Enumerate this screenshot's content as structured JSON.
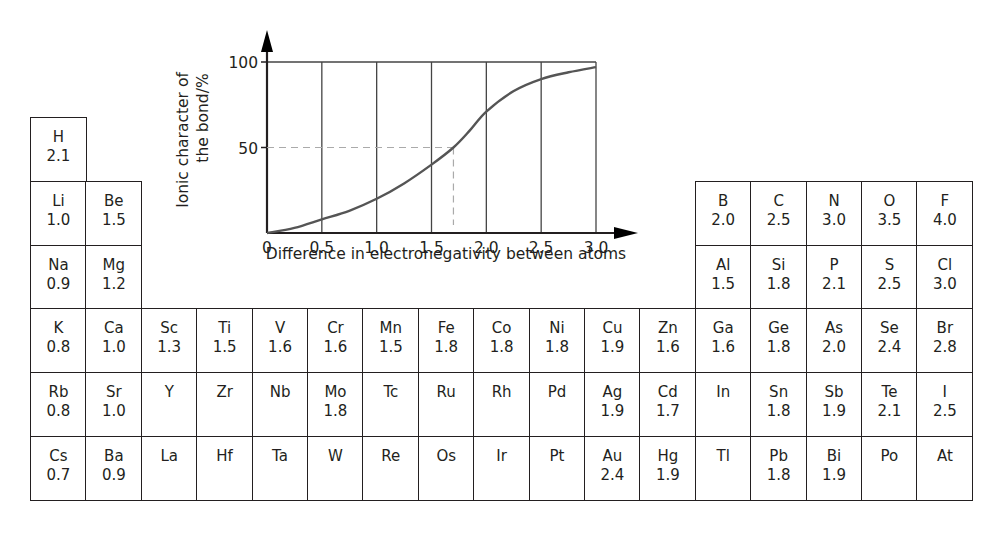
{
  "chart_data": {
    "type": "line",
    "title": "",
    "xlabel": "Difference in electronegativity between atoms",
    "ylabel_lines": [
      "Ionic character of",
      "the bond/%"
    ],
    "xlim": [
      0,
      3.0
    ],
    "ylim": [
      0,
      100
    ],
    "x_ticks": [
      "0",
      "0.5",
      "1.0",
      "1.5",
      "2.0",
      "2.5",
      "3.0"
    ],
    "x_tick_values": [
      0,
      0.5,
      1.0,
      1.5,
      2.0,
      2.5,
      3.0
    ],
    "y_ticks": [
      "50",
      "100"
    ],
    "y_tick_values": [
      50,
      100
    ],
    "grid": "vertical lines at each x tick",
    "series": [
      {
        "name": "Ionic character",
        "x": [
          0,
          0.25,
          0.5,
          0.75,
          1.0,
          1.25,
          1.5,
          1.7,
          1.85,
          2.0,
          2.25,
          2.5,
          2.75,
          3.0
        ],
        "y": [
          0,
          3,
          8,
          13,
          20,
          29,
          40,
          50,
          60,
          71,
          83,
          90,
          94,
          97
        ]
      }
    ],
    "annotations": [
      {
        "type": "dashed-guide",
        "x": 1.7,
        "y": 50,
        "text": ""
      }
    ],
    "colors": {
      "curve": "#555555",
      "axes": "#231f20",
      "grid": "#444444",
      "guide": "#aaaaaa"
    }
  },
  "periodic_table": {
    "caption": "Pauling electronegativity values",
    "rows": [
      [
        {
          "col": 1,
          "sym": "H",
          "en": "2.1"
        }
      ],
      [
        {
          "col": 1,
          "sym": "Li",
          "en": "1.0"
        },
        {
          "col": 2,
          "sym": "Be",
          "en": "1.5"
        },
        {
          "col": 13,
          "sym": "B",
          "en": "2.0"
        },
        {
          "col": 14,
          "sym": "C",
          "en": "2.5"
        },
        {
          "col": 15,
          "sym": "N",
          "en": "3.0"
        },
        {
          "col": 16,
          "sym": "O",
          "en": "3.5"
        },
        {
          "col": 17,
          "sym": "F",
          "en": "4.0"
        }
      ],
      [
        {
          "col": 1,
          "sym": "Na",
          "en": "0.9"
        },
        {
          "col": 2,
          "sym": "Mg",
          "en": "1.2"
        },
        {
          "col": 13,
          "sym": "Al",
          "en": "1.5"
        },
        {
          "col": 14,
          "sym": "Si",
          "en": "1.8"
        },
        {
          "col": 15,
          "sym": "P",
          "en": "2.1"
        },
        {
          "col": 16,
          "sym": "S",
          "en": "2.5"
        },
        {
          "col": 17,
          "sym": "Cl",
          "en": "3.0"
        }
      ],
      [
        {
          "col": 1,
          "sym": "K",
          "en": "0.8"
        },
        {
          "col": 2,
          "sym": "Ca",
          "en": "1.0"
        },
        {
          "col": 3,
          "sym": "Sc",
          "en": "1.3"
        },
        {
          "col": 4,
          "sym": "Ti",
          "en": "1.5"
        },
        {
          "col": 5,
          "sym": "V",
          "en": "1.6"
        },
        {
          "col": 6,
          "sym": "Cr",
          "en": "1.6"
        },
        {
          "col": 7,
          "sym": "Mn",
          "en": "1.5"
        },
        {
          "col": 8,
          "sym": "Fe",
          "en": "1.8"
        },
        {
          "col": 9,
          "sym": "Co",
          "en": "1.8"
        },
        {
          "col": 10,
          "sym": "Ni",
          "en": "1.8"
        },
        {
          "col": 11,
          "sym": "Cu",
          "en": "1.9"
        },
        {
          "col": 12,
          "sym": "Zn",
          "en": "1.6"
        },
        {
          "col": 13,
          "sym": "Ga",
          "en": "1.6"
        },
        {
          "col": 14,
          "sym": "Ge",
          "en": "1.8"
        },
        {
          "col": 15,
          "sym": "As",
          "en": "2.0"
        },
        {
          "col": 16,
          "sym": "Se",
          "en": "2.4"
        },
        {
          "col": 17,
          "sym": "Br",
          "en": "2.8"
        }
      ],
      [
        {
          "col": 1,
          "sym": "Rb",
          "en": "0.8"
        },
        {
          "col": 2,
          "sym": "Sr",
          "en": "1.0"
        },
        {
          "col": 3,
          "sym": "Y",
          "en": ""
        },
        {
          "col": 4,
          "sym": "Zr",
          "en": ""
        },
        {
          "col": 5,
          "sym": "Nb",
          "en": ""
        },
        {
          "col": 6,
          "sym": "Mo",
          "en": "1.8"
        },
        {
          "col": 7,
          "sym": "Tc",
          "en": ""
        },
        {
          "col": 8,
          "sym": "Ru",
          "en": ""
        },
        {
          "col": 9,
          "sym": "Rh",
          "en": ""
        },
        {
          "col": 10,
          "sym": "Pd",
          "en": ""
        },
        {
          "col": 11,
          "sym": "Ag",
          "en": "1.9"
        },
        {
          "col": 12,
          "sym": "Cd",
          "en": "1.7"
        },
        {
          "col": 13,
          "sym": "In",
          "en": ""
        },
        {
          "col": 14,
          "sym": "Sn",
          "en": "1.8"
        },
        {
          "col": 15,
          "sym": "Sb",
          "en": "1.9"
        },
        {
          "col": 16,
          "sym": "Te",
          "en": "2.1"
        },
        {
          "col": 17,
          "sym": "I",
          "en": "2.5"
        }
      ],
      [
        {
          "col": 1,
          "sym": "Cs",
          "en": "0.7"
        },
        {
          "col": 2,
          "sym": "Ba",
          "en": "0.9"
        },
        {
          "col": 3,
          "sym": "La",
          "en": ""
        },
        {
          "col": 4,
          "sym": "Hf",
          "en": ""
        },
        {
          "col": 5,
          "sym": "Ta",
          "en": ""
        },
        {
          "col": 6,
          "sym": "W",
          "en": ""
        },
        {
          "col": 7,
          "sym": "Re",
          "en": ""
        },
        {
          "col": 8,
          "sym": "Os",
          "en": ""
        },
        {
          "col": 9,
          "sym": "Ir",
          "en": ""
        },
        {
          "col": 10,
          "sym": "Pt",
          "en": ""
        },
        {
          "col": 11,
          "sym": "Au",
          "en": "2.4"
        },
        {
          "col": 12,
          "sym": "Hg",
          "en": "1.9"
        },
        {
          "col": 13,
          "sym": "Tl",
          "en": ""
        },
        {
          "col": 14,
          "sym": "Pb",
          "en": "1.8"
        },
        {
          "col": 15,
          "sym": "Bi",
          "en": "1.9"
        },
        {
          "col": 16,
          "sym": "Po",
          "en": ""
        },
        {
          "col": 17,
          "sym": "At",
          "en": ""
        }
      ]
    ]
  }
}
